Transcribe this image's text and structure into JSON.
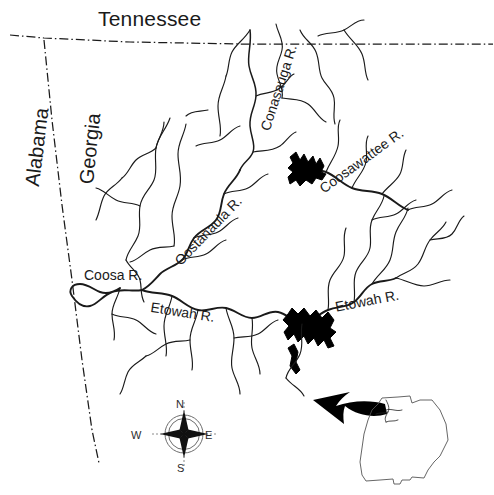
{
  "map": {
    "title_region": "Coosa River Basin, Northwest Georgia",
    "background_color": "#ffffff",
    "ink_color": "#1a1a1a",
    "reservoir_color": "#000000",
    "state_labels": [
      {
        "name": "tennessee",
        "text": "Tennessee",
        "rotation_deg": 0
      },
      {
        "name": "alabama",
        "text": "Alabama",
        "rotation_deg": -83
      },
      {
        "name": "georgia",
        "text": "Georgia",
        "rotation_deg": -84
      }
    ],
    "river_labels": [
      {
        "name": "coosa",
        "text": "Coosa R.",
        "rotation_deg": 0
      },
      {
        "name": "etowah-west",
        "text": "Etowah R.",
        "rotation_deg": 9
      },
      {
        "name": "etowah-east",
        "text": "Etowah R.",
        "rotation_deg": -11
      },
      {
        "name": "oostanaula",
        "text": "Oostanaula R.",
        "rotation_deg": -46
      },
      {
        "name": "conasauga",
        "text": "Conasauga R.",
        "rotation_deg": -72
      },
      {
        "name": "coosawattee",
        "text": "Coosawattee R.",
        "rotation_deg": -36
      }
    ],
    "compass": {
      "north": "N",
      "south": "S",
      "east": "E",
      "west": "W"
    },
    "inset": {
      "name": "georgia-state-inset",
      "description": "Georgia state outline with locator arrow"
    },
    "legend_features": {
      "state_boundary_style": "dash-dot",
      "reservoirs": [
        "Carters Lake",
        "Allatoona Lake"
      ]
    }
  }
}
